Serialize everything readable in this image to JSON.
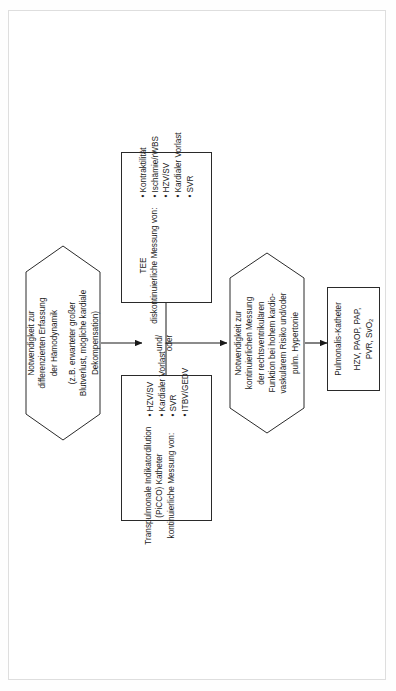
{
  "diagram": {
    "type": "flowchart",
    "orientation": "rotated-90-ccw",
    "nodes": [
      {
        "id": "indication-hemodynamics",
        "shape": "hexagon",
        "lines": [
          "Notwendigkeit zur",
          "differenzierten Erfassung",
          "der Hämodynamik",
          "(z.B. erwarteter großer",
          "Blutverlust, mögliche kardiale",
          "Dekompensation)"
        ]
      },
      {
        "id": "tee",
        "shape": "rect",
        "title": "TEE",
        "subtitle": "diskontinuierliche Messung von:",
        "bullets": [
          "Kontraktilität",
          "Ischämie/rWBS",
          "HZV/SV",
          "Kardialer Vorlast",
          "SVR"
        ]
      },
      {
        "id": "picco",
        "shape": "rect",
        "title": "Transpulmonale Indikatordilution",
        "title2": "(PiCCO) Katheter",
        "subtitle": "kontinuierliche Messung von:",
        "bullets": [
          "HZV/SV",
          "Kardialer Vorlast",
          "SVR",
          "ITBV/GEDV"
        ]
      },
      {
        "id": "indication-rv-function",
        "shape": "hexagon",
        "lines": [
          "Notwendigkeit zur",
          "kontinuierlichen Messung",
          "der rechtsventrikulären",
          "Funktion bei hohem kardio-",
          "vaskulärem Risiko und/oder",
          "pulm. Hypertonie"
        ]
      },
      {
        "id": "pulmonalis-katheter",
        "shape": "rect",
        "title": "Pulmonalis-Katheter",
        "values_line1": "HZV, PAOP, PAP,",
        "values_line2_pre": "PVR, SvO",
        "values_line2_sub": "2"
      }
    ],
    "junction": {
      "id": "und-oder",
      "line1": "und/",
      "line2": "oder"
    },
    "colors": {
      "stroke": "#2a2a2a",
      "text": "#1a1a1a",
      "background": "#ffffff",
      "page_frame": "#dedede"
    }
  }
}
